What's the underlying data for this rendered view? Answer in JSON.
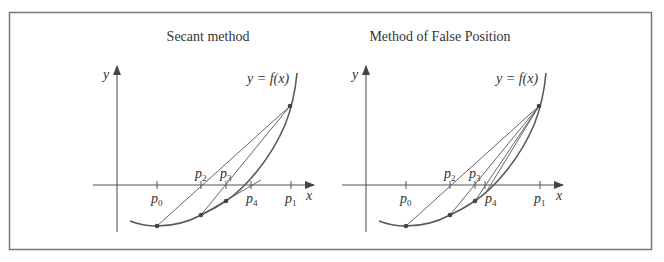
{
  "figure": {
    "frame_color": "#777777",
    "panels": [
      {
        "id": "secant",
        "title": "Secant method",
        "curve_label": "y = f(x)",
        "axis_labels": {
          "x": "x",
          "y": "y"
        },
        "ticks": [
          {
            "name": "p",
            "sub": "0"
          },
          {
            "name": "p",
            "sub": "2"
          },
          {
            "name": "p",
            "sub": "3"
          },
          {
            "name": "p",
            "sub": "4"
          },
          {
            "name": "p",
            "sub": "1"
          }
        ]
      },
      {
        "id": "false-position",
        "title": "Method of False Position",
        "curve_label": "y = f(x)",
        "axis_labels": {
          "x": "x",
          "y": "y"
        },
        "ticks": [
          {
            "name": "p",
            "sub": "0"
          },
          {
            "name": "p",
            "sub": "2"
          },
          {
            "name": "p",
            "sub": "3"
          },
          {
            "name": "p",
            "sub": "4"
          },
          {
            "name": "p",
            "sub": "1"
          }
        ]
      }
    ]
  }
}
